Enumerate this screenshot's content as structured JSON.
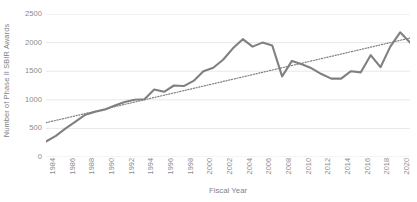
{
  "chart_data": {
    "type": "line",
    "title": "",
    "xlabel": "Fiscal Year",
    "ylabel": "Number of Phase II SBIR Awards",
    "grid": true,
    "legend": "none",
    "xlim": [
      1984,
      2021
    ],
    "ylim": [
      0,
      2500
    ],
    "y_ticks": [
      0,
      500,
      1000,
      1500,
      2000,
      2500
    ],
    "x_tick_labels": [
      "1984",
      "1986",
      "1988",
      "1990",
      "1992",
      "1994",
      "1996",
      "1998",
      "2000",
      "2002",
      "2004",
      "2006",
      "2008",
      "2010",
      "2012",
      "2014",
      "2016",
      "2018",
      "2020"
    ],
    "x": [
      1984,
      1985,
      1986,
      1987,
      1988,
      1989,
      1990,
      1991,
      1992,
      1993,
      1994,
      1995,
      1996,
      1997,
      1998,
      1999,
      2000,
      2001,
      2002,
      2003,
      2004,
      2005,
      2006,
      2007,
      2008,
      2009,
      2010,
      2011,
      2012,
      2013,
      2014,
      2015,
      2016,
      2017,
      2018,
      2019,
      2020,
      2021
    ],
    "series": [
      {
        "name": "Phase II SBIR Awards",
        "color": "#808080",
        "style": "solid",
        "values": [
          270,
          370,
          500,
          620,
          740,
          790,
          830,
          900,
          960,
          1000,
          1010,
          1180,
          1140,
          1250,
          1240,
          1330,
          1500,
          1560,
          1700,
          1900,
          2060,
          1930,
          2000,
          1950,
          1410,
          1680,
          1620,
          1550,
          1450,
          1370,
          1370,
          1500,
          1480,
          1780,
          1570,
          1930,
          2180,
          2000
        ]
      },
      {
        "name": "Linear trend",
        "color": "#7f7f7f",
        "style": "dotted",
        "values": [
          600,
          640,
          680,
          720,
          760,
          800,
          840,
          880,
          920,
          960,
          1000,
          1040,
          1080,
          1120,
          1160,
          1200,
          1240,
          1280,
          1320,
          1360,
          1400,
          1440,
          1480,
          1520,
          1560,
          1600,
          1640,
          1680,
          1720,
          1760,
          1800,
          1840,
          1880,
          1920,
          1960,
          2000,
          2040,
          2080
        ]
      }
    ]
  },
  "style": {
    "gridline_color": "#e8e8e8",
    "axis_text_color": "#8a8a8a",
    "background": "#ffffff"
  }
}
